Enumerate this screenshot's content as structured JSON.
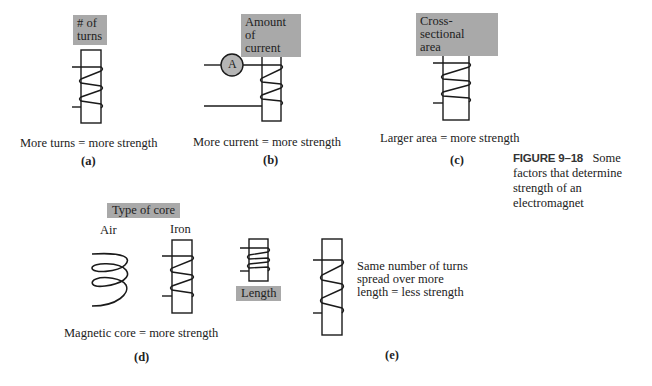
{
  "figure": {
    "number": "FIGURE 9–18",
    "caption": "Some factors that determine strength of an electromagnet"
  },
  "panels": {
    "a": {
      "tag_line1": "# of",
      "tag_line2": "turns",
      "caption": "More turns = more strength",
      "label": "(a)"
    },
    "b": {
      "tag_line1": "Amount of",
      "tag_line2": "current",
      "ammeter_symbol": "A",
      "caption": "More current = more strength",
      "label": "(b)"
    },
    "c": {
      "tag_line1": "Cross-sectional",
      "tag_line2": "area",
      "caption": "Larger area = more strength",
      "label": "(c)"
    },
    "d": {
      "tag": "Type of core",
      "air_label": "Air",
      "iron_label": "Iron",
      "caption": "Magnetic core = more strength",
      "label": "(d)"
    },
    "e": {
      "tag": "Length",
      "note_line1": "Same number of turns",
      "note_line2": "spread over more",
      "note_line3": "length = less strength",
      "label": "(e)"
    }
  },
  "colors": {
    "tag_bg": "#a9a9a9",
    "line": "#1a1a1a",
    "ammeter_fill": "#b5b5b5"
  }
}
